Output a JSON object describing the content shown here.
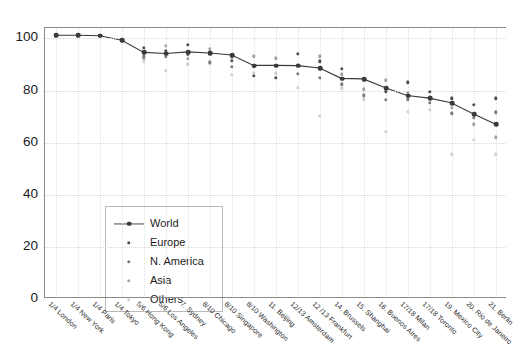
{
  "chart_data": {
    "type": "scatter",
    "title": "",
    "xlabel": "",
    "ylabel": "",
    "ylim": [
      0,
      104
    ],
    "yticks": [
      0,
      20,
      40,
      60,
      80,
      100
    ],
    "grid": true,
    "legend_position": "lower-left-inside",
    "categories": [
      "1/4 London",
      "1/4 New York",
      "1/4 Paris",
      "1/4 Tokyo",
      "5/6 Hong Kong",
      "5/6 Los Angeles",
      "7. Sydney",
      "8/10 Chicago",
      "8/10 Singapore",
      "8/10 Washington",
      "11. Beijing",
      "12/13 Amsterdam",
      "12 /13 Frankfurt",
      "14. Brussels",
      "15. Shanghai",
      "16. Buenos Aires",
      "17/18 Milan",
      "17/18 Toronto",
      "19. Mexico City",
      "20. Rio de Janeiro",
      "21. Berlin"
    ],
    "series": [
      {
        "name": "World",
        "marker": "line-dot",
        "color": "#3a3a3a",
        "values": [
          101.2,
          101.2,
          101.0,
          99.3,
          94.6,
          94.2,
          94.8,
          94.4,
          93.6,
          89.6,
          89.6,
          89.5,
          88.6,
          84.6,
          84.4,
          81.0,
          78.0,
          77.0,
          75.2,
          71.0,
          67.0
        ]
      },
      {
        "name": "Europe",
        "marker": "dot",
        "color": "#4d4d4d",
        "values": [
          101.2,
          101.2,
          101.0,
          99.3,
          96.5,
          95.0,
          97.6,
          94.6,
          91.4,
          85.6,
          84.8,
          94.0,
          91.2,
          88.4,
          84.2,
          79.4,
          83.2,
          79.6,
          77.0,
          74.6,
          77.0
        ]
      },
      {
        "name": "N. America",
        "marker": "dot",
        "color": "#7b7b7b",
        "values": [
          101.2,
          101.2,
          101.0,
          99.3,
          93.2,
          93.0,
          93.8,
          90.8,
          89.2,
          89.2,
          89.6,
          86.4,
          85.0,
          82.4,
          78.2,
          76.4,
          76.6,
          75.4,
          71.2,
          69.6,
          71.6
        ]
      },
      {
        "name": "Asia",
        "marker": "dot",
        "color": "#a3a3a3",
        "values": [
          101.2,
          101.2,
          101.0,
          99.3,
          92.4,
          97.2,
          92.2,
          96.0,
          92.6,
          93.2,
          92.4,
          89.8,
          93.2,
          86.2,
          80.4,
          84.0,
          79.2,
          77.4,
          73.4,
          67.0,
          62.0
        ]
      },
      {
        "name": "Others",
        "marker": "dot",
        "color": "#cfcfcf",
        "values": [
          101.2,
          101.2,
          101.0,
          99.3,
          91.0,
          87.6,
          90.0,
          90.4,
          86.0,
          86.8,
          86.6,
          81.0,
          70.2,
          80.8,
          76.6,
          64.2,
          71.8,
          72.6,
          55.6,
          61.0,
          55.6
        ]
      }
    ],
    "legend": [
      {
        "label": "World",
        "marker": "line-dot",
        "color": "#3a3a3a"
      },
      {
        "label": "Europe",
        "marker": "dot",
        "color": "#4d4d4d"
      },
      {
        "label": "N. America",
        "marker": "dot",
        "color": "#7b7b7b"
      },
      {
        "label": "Asia",
        "marker": "dot",
        "color": "#a3a3a3"
      },
      {
        "label": "Others",
        "marker": "dot",
        "color": "#cfcfcf"
      }
    ]
  }
}
